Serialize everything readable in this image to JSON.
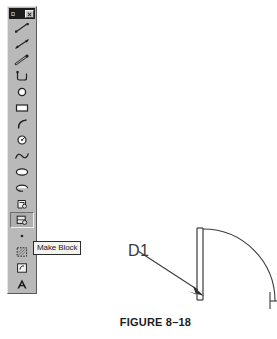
{
  "toolbar": {
    "title": "D",
    "close_label": "x",
    "close_icon": "close-icon",
    "tools": [
      {
        "id": "line",
        "label": "Line",
        "icon": "line-icon"
      },
      {
        "id": "construction-line",
        "label": "Construction Line",
        "icon": "construction-line-icon"
      },
      {
        "id": "polyline",
        "label": "Polyline",
        "icon": "polyline-icon"
      },
      {
        "id": "polygon",
        "label": "Polygon",
        "icon": "polygon-icon"
      },
      {
        "id": "circle-filled",
        "label": "Circle",
        "icon": "circle-icon"
      },
      {
        "id": "rectangle",
        "label": "Rectangle",
        "icon": "rectangle-icon"
      },
      {
        "id": "arc",
        "label": "Arc",
        "icon": "arc-icon"
      },
      {
        "id": "circle-radius",
        "label": "Circle Radius",
        "icon": "circle-radius-icon"
      },
      {
        "id": "spline",
        "label": "Spline",
        "icon": "spline-icon"
      },
      {
        "id": "ellipse",
        "label": "Ellipse",
        "icon": "ellipse-icon"
      },
      {
        "id": "ellipse-arc",
        "label": "Ellipse Arc",
        "icon": "ellipse-arc-icon"
      },
      {
        "id": "insert-block",
        "label": "Insert Block",
        "icon": "insert-block-icon"
      },
      {
        "id": "make-block",
        "label": "Make Block",
        "icon": "make-block-icon"
      },
      {
        "id": "point",
        "label": "Point",
        "icon": "point-icon"
      },
      {
        "id": "hatch",
        "label": "Hatch",
        "icon": "hatch-icon"
      },
      {
        "id": "region",
        "label": "Region",
        "icon": "region-icon"
      },
      {
        "id": "multiline-text",
        "label": "Multiline Text",
        "icon": "text-icon"
      }
    ],
    "pressed_tool_id": "make-block"
  },
  "tooltip": {
    "text": "Make Block"
  },
  "drawing": {
    "callout_label": "D1",
    "description": "Architectural door swing symbol with door panel and 90 degree arc"
  },
  "caption": {
    "text": "FIGURE 8–18"
  },
  "colors": {
    "toolbar_face": "#b9b9b9",
    "titlebar": "#1c1c1c",
    "tooltip_bg": "#f3f3f0",
    "ink": "#3b3b3b",
    "caption": "#1d1d1d"
  }
}
